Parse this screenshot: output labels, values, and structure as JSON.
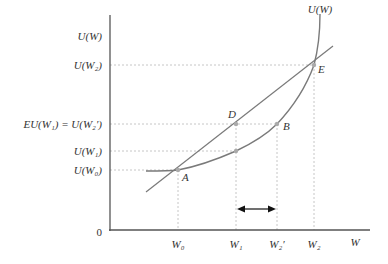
{
  "diagram": {
    "axes": {
      "y_axis_label": "U(W)",
      "x_axis_label": "W",
      "origin_label": "0"
    },
    "curve_label": "U(W)",
    "y_ticks": [
      {
        "id": "uw2",
        "label": "U(W₂)"
      },
      {
        "id": "eu",
        "label": "EU(W₁) = U(W₂′)"
      },
      {
        "id": "uw1",
        "label": "U(W₁)"
      },
      {
        "id": "uw0",
        "label": "U(W₀)"
      }
    ],
    "x_ticks": [
      {
        "id": "w0",
        "label": "W₀"
      },
      {
        "id": "w1",
        "label": "W₁"
      },
      {
        "id": "w2p",
        "label": "W₂′"
      },
      {
        "id": "w2",
        "label": "W₂"
      }
    ],
    "points": {
      "A": "A",
      "B": "B",
      "D": "D",
      "E": "E"
    },
    "colors": {
      "curve": "#7a7a7a",
      "axis": "#555555",
      "guide": "#b0b0b0",
      "point": "#aaaaaa",
      "arrow": "#111111"
    }
  }
}
